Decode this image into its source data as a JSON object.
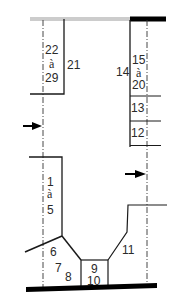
{
  "diagram": {
    "labels": {
      "upper_left_range": [
        "22",
        "à",
        "29"
      ],
      "upper_left_single": "21",
      "upper_right_range": [
        "15",
        "à",
        "20"
      ],
      "upper_right_single": "14",
      "right_13": "13",
      "right_12": "12",
      "lower_left_range": [
        "1",
        "à",
        "5"
      ],
      "l6": "6",
      "l7": "7",
      "l8": "8",
      "l9": "9",
      "l10": "10",
      "l11": "11"
    },
    "colors": {
      "line": "#1a1a1a",
      "top_left_bar": "#8a8a8a",
      "thick_bar": "#000000",
      "axis": "#333333"
    }
  }
}
